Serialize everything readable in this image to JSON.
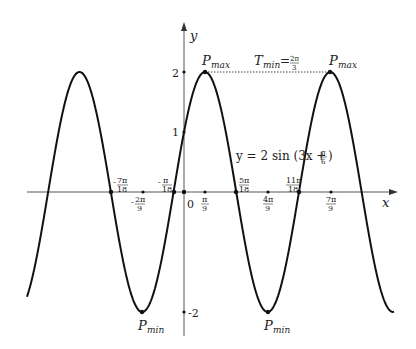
{
  "chart_data": {
    "type": "line",
    "title": "",
    "function": "y = 2sin(3x + π/6)",
    "xlabel": "x",
    "ylabel": "y",
    "amplitude": 2,
    "angular_frequency": 3,
    "phase": "π/6",
    "period": "2π/3",
    "y_ticks": [
      "2",
      "1",
      "-2"
    ],
    "x_tick_labels": [
      "-7π/18",
      "-2π/9",
      "-π/18",
      "0",
      "π/9",
      "5π/18",
      "4π/9",
      "11π/18",
      "7π/9"
    ],
    "zeros": [
      "-7π/18",
      "-π/18",
      "5π/18",
      "11π/18"
    ],
    "annotations": {
      "pmax_left": "P_max",
      "pmax_right": "P_max",
      "pmin_left": "P_min",
      "pmin_right": "P_min",
      "period_label": "T_min = 2π/3",
      "equation_label": "y = 2sin(3x + π/6)"
    },
    "points": {
      "P_max_1": {
        "x": "π/9",
        "y": 2
      },
      "P_max_2": {
        "x": "7π/9",
        "y": 2
      },
      "P_min_1": {
        "x": "-2π/9",
        "y": -2
      },
      "P_min_2": {
        "x": "4π/9",
        "y": -2
      }
    }
  },
  "labels": {
    "y_axis": "y",
    "x_axis": "x",
    "y2": "2",
    "y1": "1",
    "yneg2": "-2",
    "origin": "0",
    "pmax": "P",
    "max_sub": "max",
    "pmin": "P",
    "min_sub": "min",
    "T": "T",
    "eq_pre": "= ",
    "two_pi": "2π",
    "three": "3",
    "eq": "y = 2 sin (3x + ",
    "pi": "π",
    "six": "6",
    "close": ")",
    "ticks": {
      "m7pi18": {
        "sign": "-",
        "num": "7π",
        "den": "18"
      },
      "m2pi9": {
        "sign": "-",
        "num": "2π",
        "den": "9"
      },
      "mpi18": {
        "sign": "-",
        "num": "π",
        "den": "18"
      },
      "pi9": {
        "sign": "",
        "num": "π",
        "den": "9"
      },
      "5pi18": {
        "sign": "",
        "num": "5π",
        "den": "18"
      },
      "4pi9": {
        "sign": "",
        "num": "4π",
        "den": "9"
      },
      "11pi18": {
        "sign": "",
        "num": "11π",
        "den": "18"
      },
      "7pi9": {
        "sign": "",
        "num": "7π",
        "den": "9"
      }
    }
  }
}
